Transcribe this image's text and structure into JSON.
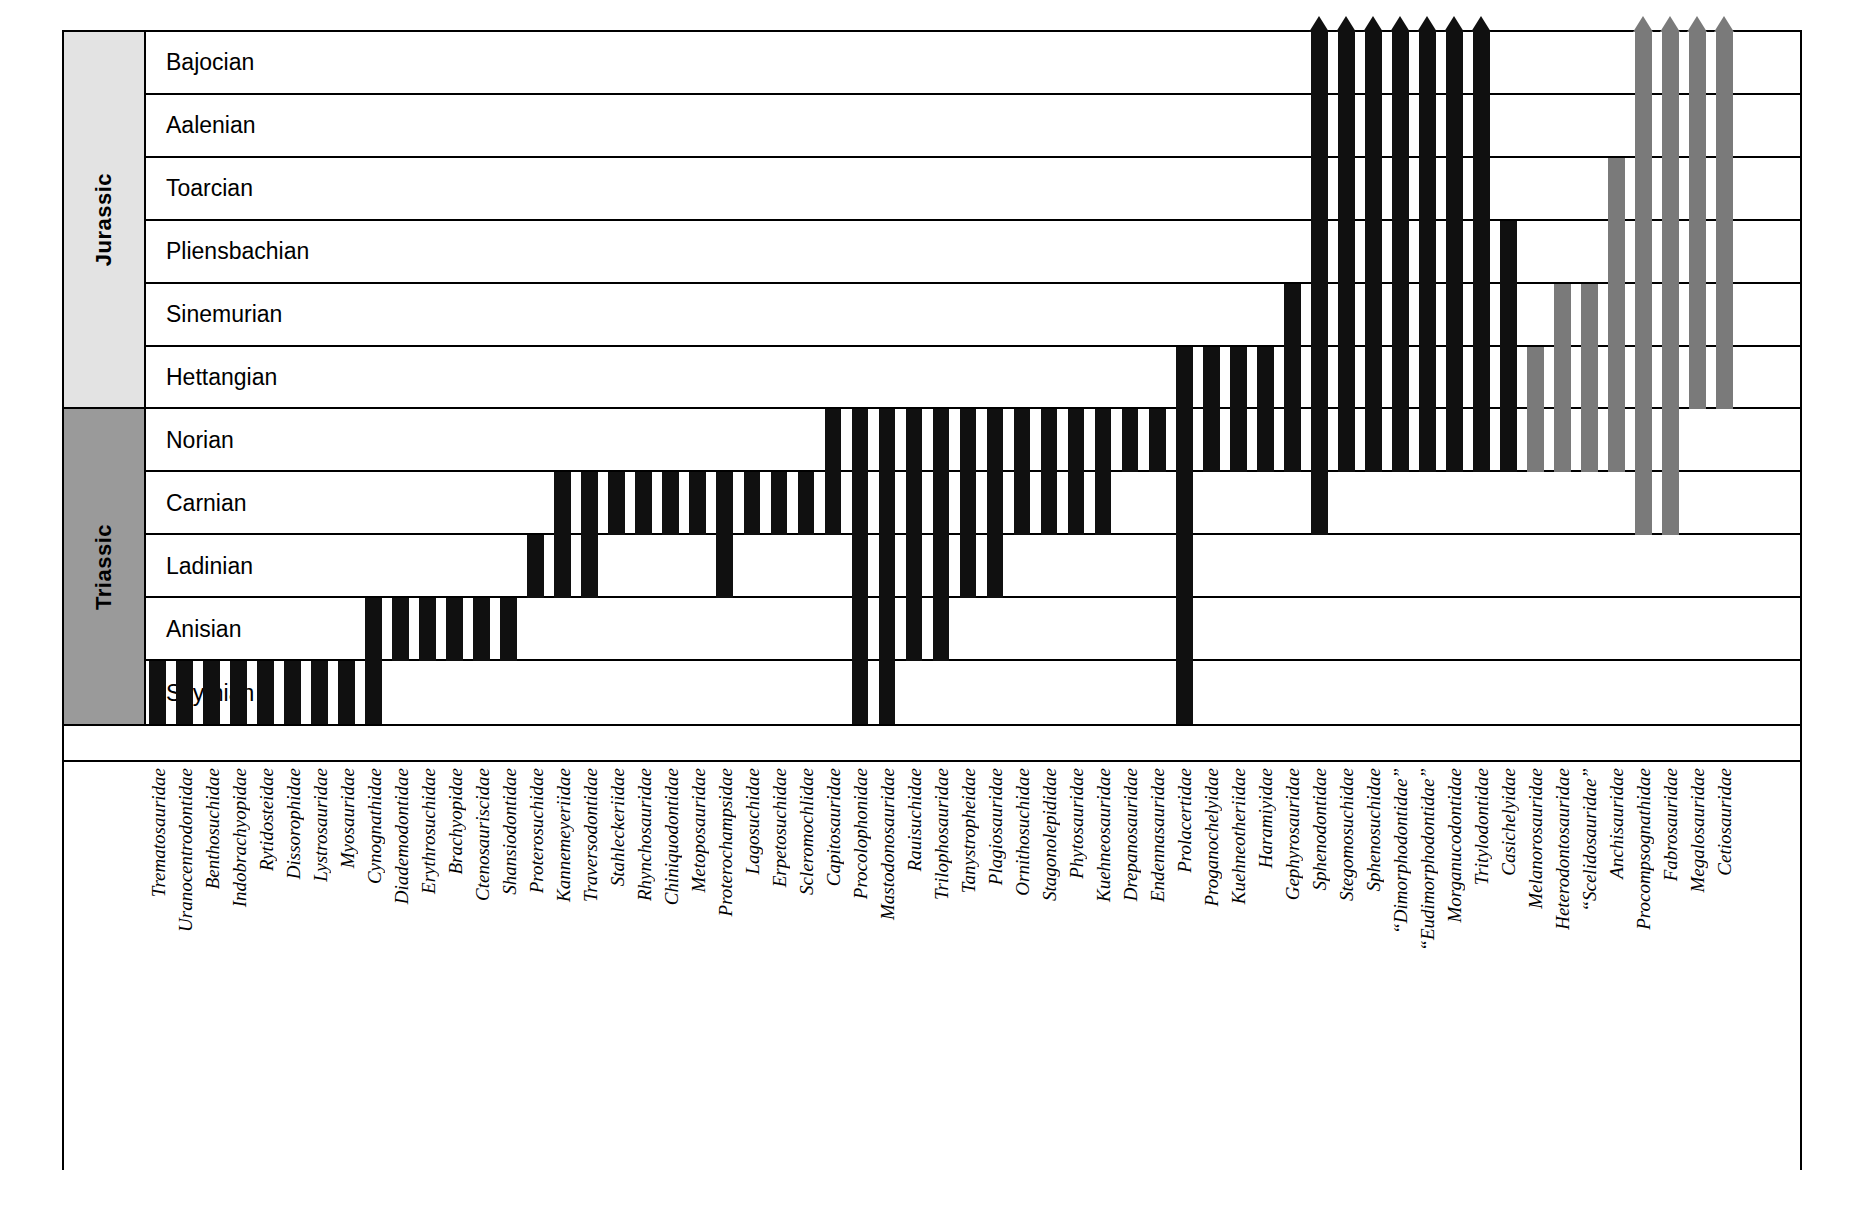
{
  "chart_data": {
    "type": "table",
    "xlabel": "",
    "ylabel": "",
    "grid": false,
    "legend": "none",
    "colors": {
      "range_bar_black": "#101010",
      "range_bar_grey": "#7a7a7a",
      "jurassic_band": "#e3e3e3",
      "triassic_band": "#9a9a9a",
      "frame": "#000000",
      "background": "#ffffff"
    },
    "periods": [
      {
        "name": "Jurassic",
        "first_stage_index": 0,
        "last_stage_index": 5,
        "fill": "#e3e3e3"
      },
      {
        "name": "Triassic",
        "first_stage_index": 6,
        "last_stage_index": 10,
        "fill": "#9a9a9a"
      }
    ],
    "stages_top_to_bottom": [
      "Bajocian",
      "Aalenian",
      "Toarcian",
      "Pliensbachian",
      "Sinemurian",
      "Hettangian",
      "Norian",
      "Carnian",
      "Ladinian",
      "Anisian",
      "Scythian"
    ],
    "stage_count": 11,
    "note_on_ranges": "range_top / range_bottom are stage names; rows are ordered oldest (Scythian) at bottom to youngest (Bajocian) at top. arrow=true means the range continues beyond the top of the chart.",
    "taxa": [
      {
        "name": "Trematosauridae",
        "range_bottom": "Scythian",
        "range_top": "Scythian",
        "arrow": false,
        "color": "black"
      },
      {
        "name": "Uranocentrodontidae",
        "range_bottom": "Scythian",
        "range_top": "Scythian",
        "arrow": false,
        "color": "black"
      },
      {
        "name": "Benthosuchidae",
        "range_bottom": "Scythian",
        "range_top": "Scythian",
        "arrow": false,
        "color": "black"
      },
      {
        "name": "Indobrachyopidae",
        "range_bottom": "Scythian",
        "range_top": "Scythian",
        "arrow": false,
        "color": "black"
      },
      {
        "name": "Rytidosteidae",
        "range_bottom": "Scythian",
        "range_top": "Scythian",
        "arrow": false,
        "color": "black"
      },
      {
        "name": "Dissorophidae",
        "range_bottom": "Scythian",
        "range_top": "Scythian",
        "arrow": false,
        "color": "black"
      },
      {
        "name": "Lystrosauridae",
        "range_bottom": "Scythian",
        "range_top": "Scythian",
        "arrow": false,
        "color": "black"
      },
      {
        "name": "Myosauridae",
        "range_bottom": "Scythian",
        "range_top": "Scythian",
        "arrow": false,
        "color": "black"
      },
      {
        "name": "Cynognathidae",
        "range_bottom": "Scythian",
        "range_top": "Anisian",
        "arrow": false,
        "color": "black"
      },
      {
        "name": "Diademodontidae",
        "range_bottom": "Anisian",
        "range_top": "Anisian",
        "arrow": false,
        "color": "black"
      },
      {
        "name": "Erythrosuchidae",
        "range_bottom": "Anisian",
        "range_top": "Anisian",
        "arrow": false,
        "color": "black"
      },
      {
        "name": "Brachyopidae",
        "range_bottom": "Anisian",
        "range_top": "Anisian",
        "arrow": false,
        "color": "black"
      },
      {
        "name": "Ctenosauriscidae",
        "range_bottom": "Anisian",
        "range_top": "Anisian",
        "arrow": false,
        "color": "black"
      },
      {
        "name": "Shansiodontidae",
        "range_bottom": "Anisian",
        "range_top": "Anisian",
        "arrow": false,
        "color": "black"
      },
      {
        "name": "Proterosuchidae",
        "range_bottom": "Ladinian",
        "range_top": "Ladinian",
        "arrow": false,
        "color": "black"
      },
      {
        "name": "Kannemeyeriidae",
        "range_bottom": "Ladinian",
        "range_top": "Carnian",
        "arrow": false,
        "color": "black"
      },
      {
        "name": "Traversodontidae",
        "range_bottom": "Ladinian",
        "range_top": "Carnian",
        "arrow": false,
        "color": "black"
      },
      {
        "name": "Stahleckeriidae",
        "range_bottom": "Carnian",
        "range_top": "Carnian",
        "arrow": false,
        "color": "black"
      },
      {
        "name": "Rhynchosauridae",
        "range_bottom": "Carnian",
        "range_top": "Carnian",
        "arrow": false,
        "color": "black"
      },
      {
        "name": "Chiniquodontidae",
        "range_bottom": "Carnian",
        "range_top": "Carnian",
        "arrow": false,
        "color": "black"
      },
      {
        "name": "Metoposauridae",
        "range_bottom": "Carnian",
        "range_top": "Carnian",
        "arrow": false,
        "color": "black"
      },
      {
        "name": "Proterochampsidae",
        "range_bottom": "Ladinian",
        "range_top": "Carnian",
        "arrow": false,
        "color": "black"
      },
      {
        "name": "Lagosuchidae",
        "range_bottom": "Carnian",
        "range_top": "Carnian",
        "arrow": false,
        "color": "black"
      },
      {
        "name": "Erpetosuchidae",
        "range_bottom": "Carnian",
        "range_top": "Carnian",
        "arrow": false,
        "color": "black"
      },
      {
        "name": "Scleromochlidae",
        "range_bottom": "Carnian",
        "range_top": "Carnian",
        "arrow": false,
        "color": "black"
      },
      {
        "name": "Capitosauridae",
        "range_bottom": "Carnian",
        "range_top": "Norian",
        "arrow": false,
        "color": "black"
      },
      {
        "name": "Procolophonidae",
        "range_bottom": "Scythian",
        "range_top": "Norian",
        "arrow": false,
        "color": "black"
      },
      {
        "name": "Mastodonosauridae",
        "range_bottom": "Scythian",
        "range_top": "Norian",
        "arrow": false,
        "color": "black"
      },
      {
        "name": "Rauisuchidae",
        "range_bottom": "Anisian",
        "range_top": "Norian",
        "arrow": false,
        "color": "black"
      },
      {
        "name": "Trilophosauridae",
        "range_bottom": "Anisian",
        "range_top": "Norian",
        "arrow": false,
        "color": "black"
      },
      {
        "name": "Tanystropheidae",
        "range_bottom": "Ladinian",
        "range_top": "Norian",
        "arrow": false,
        "color": "black"
      },
      {
        "name": "Plagiosauridae",
        "range_bottom": "Ladinian",
        "range_top": "Norian",
        "arrow": false,
        "color": "black"
      },
      {
        "name": "Ornithosuchidae",
        "range_bottom": "Carnian",
        "range_top": "Norian",
        "arrow": false,
        "color": "black"
      },
      {
        "name": "Stagonolepididae",
        "range_bottom": "Carnian",
        "range_top": "Norian",
        "arrow": false,
        "color": "black"
      },
      {
        "name": "Phytosauridae",
        "range_bottom": "Carnian",
        "range_top": "Norian",
        "arrow": false,
        "color": "black"
      },
      {
        "name": "Kuehneosauridae",
        "range_bottom": "Carnian",
        "range_top": "Norian",
        "arrow": false,
        "color": "black"
      },
      {
        "name": "Drepanosauridae",
        "range_bottom": "Norian",
        "range_top": "Norian",
        "arrow": false,
        "color": "black"
      },
      {
        "name": "Endennasauridae",
        "range_bottom": "Norian",
        "range_top": "Norian",
        "arrow": false,
        "color": "black"
      },
      {
        "name": "Prolacertidae",
        "range_bottom": "Scythian",
        "range_top": "Hettangian",
        "arrow": false,
        "color": "black"
      },
      {
        "name": "Proganochelyidae",
        "range_bottom": "Norian",
        "range_top": "Hettangian",
        "arrow": false,
        "color": "black"
      },
      {
        "name": "Kuehneotheriidae",
        "range_bottom": "Norian",
        "range_top": "Hettangian",
        "arrow": false,
        "color": "black"
      },
      {
        "name": "Haramiyidae",
        "range_bottom": "Norian",
        "range_top": "Hettangian",
        "arrow": false,
        "color": "black"
      },
      {
        "name": "Gephyrosauridae",
        "range_bottom": "Norian",
        "range_top": "Sinemurian",
        "arrow": false,
        "color": "black"
      },
      {
        "name": "Sphenodontidae",
        "range_bottom": "Carnian",
        "range_top": "Bajocian",
        "arrow": true,
        "color": "black"
      },
      {
        "name": "Stegomosuchidae",
        "range_bottom": "Norian",
        "range_top": "Bajocian",
        "arrow": true,
        "color": "black"
      },
      {
        "name": "Sphenosuchidae",
        "range_bottom": "Norian",
        "range_top": "Bajocian",
        "arrow": true,
        "color": "black"
      },
      {
        "name": "“Dimorphodontidae”",
        "range_bottom": "Norian",
        "range_top": "Bajocian",
        "arrow": true,
        "color": "black"
      },
      {
        "name": "“Eudimorphodontidae”",
        "range_bottom": "Norian",
        "range_top": "Bajocian",
        "arrow": true,
        "color": "black"
      },
      {
        "name": "Morganucodontidae",
        "range_bottom": "Norian",
        "range_top": "Bajocian",
        "arrow": true,
        "color": "black"
      },
      {
        "name": "Tritylodontidae",
        "range_bottom": "Norian",
        "range_top": "Bajocian",
        "arrow": true,
        "color": "black"
      },
      {
        "name": "Casichelyidae",
        "range_bottom": "Norian",
        "range_top": "Pliensbachian",
        "arrow": false,
        "color": "black"
      },
      {
        "name": "Melanorosauridae",
        "range_bottom": "Norian",
        "range_top": "Hettangian",
        "arrow": false,
        "color": "grey"
      },
      {
        "name": "Heterodontosauridae",
        "range_bottom": "Norian",
        "range_top": "Sinemurian",
        "arrow": false,
        "color": "grey"
      },
      {
        "name": "“Scelidosauridae”",
        "range_bottom": "Norian",
        "range_top": "Sinemurian",
        "arrow": false,
        "color": "grey"
      },
      {
        "name": "Anchisauridae",
        "range_bottom": "Norian",
        "range_top": "Toarcian",
        "arrow": false,
        "color": "grey"
      },
      {
        "name": "Procompsognathidae",
        "range_bottom": "Carnian",
        "range_top": "Bajocian",
        "arrow": true,
        "color": "grey"
      },
      {
        "name": "Fabrosauridae",
        "range_bottom": "Carnian",
        "range_top": "Bajocian",
        "arrow": true,
        "color": "grey"
      },
      {
        "name": "Megalosauridae",
        "range_bottom": "Hettangian",
        "range_top": "Bajocian",
        "arrow": true,
        "color": "grey"
      },
      {
        "name": "Cetiosauridae",
        "range_bottom": "Hettangian",
        "range_top": "Bajocian",
        "arrow": true,
        "color": "grey"
      }
    ]
  }
}
